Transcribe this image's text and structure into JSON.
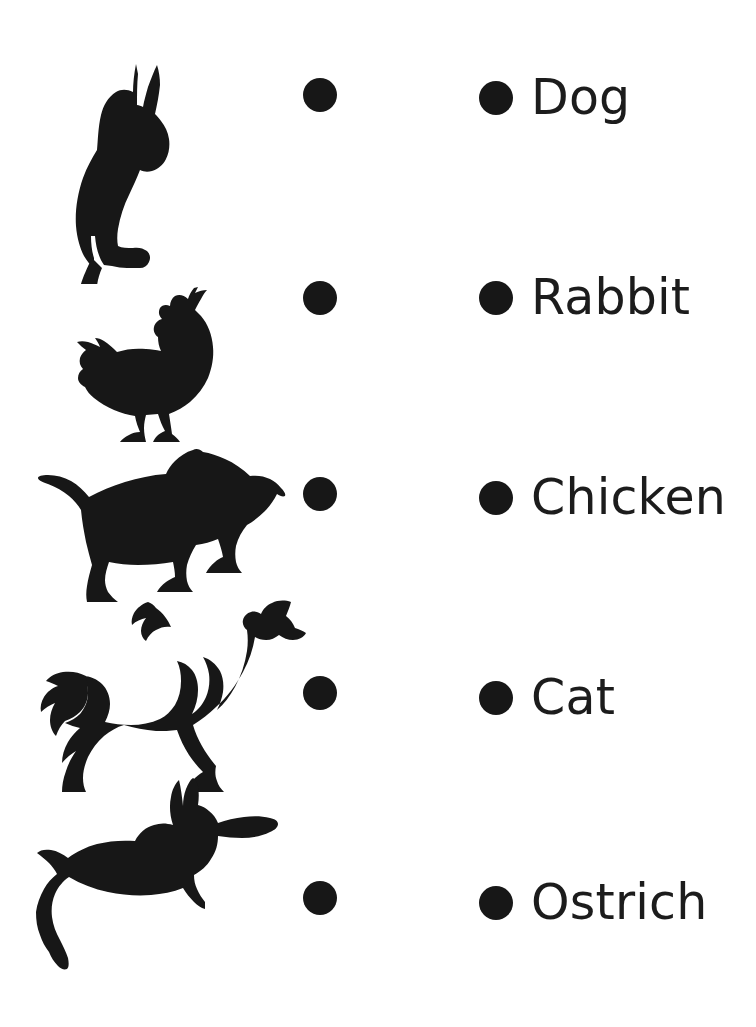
{
  "page": {
    "background_color": "#ffffff",
    "ink_color": "#171717",
    "width": 756,
    "height": 1027
  },
  "left_column": {
    "description": "Animal silhouettes with connector bullets",
    "items": [
      {
        "id": "cat-silhouette",
        "animal": "Cat",
        "icon": "cat-sitting-silhouette",
        "bullet": "connector-bullet"
      },
      {
        "id": "chicken-silhouette",
        "animal": "Chicken",
        "icon": "chicken-standing-silhouette",
        "bullet": "connector-bullet"
      },
      {
        "id": "dog-silhouette",
        "animal": "Dog",
        "icon": "dog-running-silhouette",
        "bullet": "connector-bullet"
      },
      {
        "id": "ostrich-silhouette",
        "animal": "Ostrich",
        "icon": "ostrich-running-silhouette",
        "bullet": "connector-bullet"
      },
      {
        "id": "rabbit-silhouette",
        "animal": "Rabbit",
        "icon": "rabbit-leaping-silhouette",
        "bullet": "connector-bullet"
      }
    ]
  },
  "right_column": {
    "description": "Animal name labels with connector bullets",
    "items": [
      {
        "id": "label-dog",
        "label": "Dog",
        "bullet": "connector-bullet"
      },
      {
        "id": "label-rabbit",
        "label": "Rabbit",
        "bullet": "connector-bullet"
      },
      {
        "id": "label-chicken",
        "label": "Chicken",
        "bullet": "connector-bullet"
      },
      {
        "id": "label-cat",
        "label": "Cat",
        "bullet": "connector-bullet"
      },
      {
        "id": "label-ostrich",
        "label": "Ostrich",
        "bullet": "connector-bullet"
      }
    ]
  }
}
